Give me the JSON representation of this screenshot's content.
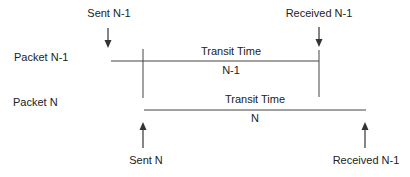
{
  "diagram": {
    "packets": [
      {
        "label": "Packet N-1",
        "sent_label": "Sent N-1",
        "received_label": "Received N-1",
        "transit_label": "Transit Time",
        "transit_sub": "N-1"
      },
      {
        "label": "Packet N",
        "sent_label": "Sent N",
        "received_label": "Received N-1",
        "transit_label": "Transit Time",
        "transit_sub": "N"
      }
    ],
    "colors": {
      "line": "#333333",
      "text": "#222222",
      "background": "#ffffff"
    }
  }
}
